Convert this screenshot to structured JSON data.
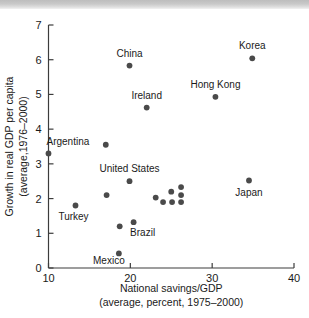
{
  "figure": {
    "name": "savings-growth-scatter",
    "background_color": "#ffffff",
    "dot_color": "#4a4a4a",
    "axis_color": "#3c3c3c"
  },
  "chart_data": {
    "type": "scatter",
    "title": "",
    "xlabel": "National savings/GDP",
    "xlabel_line2": "(average, percent, 1975–2000)",
    "ylabel": "Growth in real GDP per capita",
    "ylabel_line2": "(average,1976–2000)",
    "xlim": [
      10,
      40
    ],
    "ylim": [
      0,
      7
    ],
    "xticks": [
      10,
      20,
      30,
      40
    ],
    "xtick_labels": [
      "10",
      "20",
      "30",
      "40"
    ],
    "yticks": [
      0,
      1,
      2,
      3,
      4,
      5,
      6,
      7
    ],
    "ytick_labels": [
      "0",
      "1",
      "2",
      "3",
      "4",
      "5",
      "6",
      "7"
    ],
    "grid": false,
    "legend": false,
    "points": [
      {
        "label": "Argentina",
        "x": 10.0,
        "y": 3.3,
        "label_dx": -2,
        "label_dy": -8,
        "label_anchor": "start"
      },
      {
        "label": "Turkey",
        "x": 13.3,
        "y": 1.8,
        "label_dx": -2,
        "label_dy": 14,
        "label_anchor": "middle"
      },
      {
        "label": "",
        "x": 17.0,
        "y": 3.55,
        "label_dx": 0,
        "label_dy": 0,
        "label_anchor": "middle"
      },
      {
        "label": "",
        "x": 17.1,
        "y": 2.1,
        "label_dx": 0,
        "label_dy": 0,
        "label_anchor": "middle"
      },
      {
        "label": "Mexico",
        "x": 18.6,
        "y": 0.42,
        "label_dx": -10,
        "label_dy": 11,
        "label_anchor": "middle"
      },
      {
        "label": "",
        "x": 18.7,
        "y": 1.2,
        "label_dx": 0,
        "label_dy": 0,
        "label_anchor": "middle"
      },
      {
        "label": "China",
        "x": 19.9,
        "y": 5.83,
        "label_dx": 0,
        "label_dy": -9,
        "label_anchor": "middle"
      },
      {
        "label": "United States",
        "x": 19.9,
        "y": 2.5,
        "label_dx": 0,
        "label_dy": -9,
        "label_anchor": "middle"
      },
      {
        "label": "Brazil",
        "x": 20.4,
        "y": 1.32,
        "label_dx": 9,
        "label_dy": 14,
        "label_anchor": "middle"
      },
      {
        "label": "Ireland",
        "x": 22.0,
        "y": 4.62,
        "label_dx": 0,
        "label_dy": -9,
        "label_anchor": "middle"
      },
      {
        "label": "",
        "x": 23.1,
        "y": 2.03,
        "label_dx": 0,
        "label_dy": 0,
        "label_anchor": "middle"
      },
      {
        "label": "",
        "x": 24.0,
        "y": 1.9,
        "label_dx": 0,
        "label_dy": 0,
        "label_anchor": "middle"
      },
      {
        "label": "",
        "x": 25.0,
        "y": 2.2,
        "label_dx": 0,
        "label_dy": 0,
        "label_anchor": "middle"
      },
      {
        "label": "",
        "x": 25.1,
        "y": 1.9,
        "label_dx": 0,
        "label_dy": 0,
        "label_anchor": "middle"
      },
      {
        "label": "",
        "x": 26.2,
        "y": 2.33,
        "label_dx": 0,
        "label_dy": 0,
        "label_anchor": "middle"
      },
      {
        "label": "",
        "x": 26.2,
        "y": 2.1,
        "label_dx": 0,
        "label_dy": 0,
        "label_anchor": "middle"
      },
      {
        "label": "",
        "x": 26.2,
        "y": 1.9,
        "label_dx": 0,
        "label_dy": 0,
        "label_anchor": "middle"
      },
      {
        "label": "Hong Kong",
        "x": 30.4,
        "y": 4.93,
        "label_dx": 0,
        "label_dy": -9,
        "label_anchor": "middle"
      },
      {
        "label": "Japan",
        "x": 34.5,
        "y": 2.52,
        "label_dx": 0,
        "label_dy": 15,
        "label_anchor": "middle"
      },
      {
        "label": "Korea",
        "x": 34.9,
        "y": 6.04,
        "label_dx": 0,
        "label_dy": -9,
        "label_anchor": "middle"
      }
    ]
  }
}
